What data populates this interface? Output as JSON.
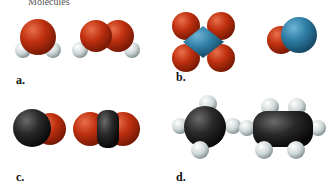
{
  "top_fragment": "Molecules",
  "panels": [
    {
      "label": "a.",
      "molecules": [
        "water (H2O)",
        "hydrogen peroxide (H2O2)"
      ]
    },
    {
      "label": "b.",
      "molecules": [
        "dinitrogen tetroxide (N2O4)",
        "nitrogen monoxide (NO)"
      ]
    },
    {
      "label": "c.",
      "molecules": [
        "carbon monoxide (CO)",
        "carbon dioxide (CO2)"
      ]
    },
    {
      "label": "d.",
      "molecules": [
        "methane (CH4)",
        "ethane (C2H6)"
      ]
    }
  ],
  "colors": {
    "oxygen": "#c0300f",
    "hydrogen": "#d8dede",
    "nitrogen": "#2f7fa6",
    "carbon": "#2a2a2a"
  }
}
